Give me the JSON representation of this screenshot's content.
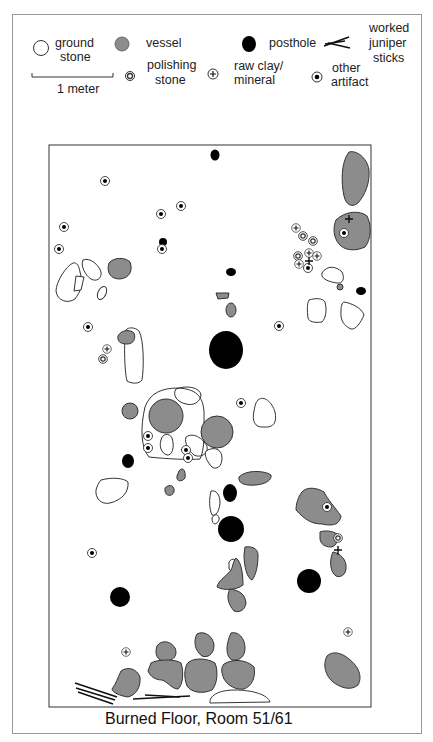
{
  "title": "Burned Floor, Room 51/61",
  "colors": {
    "vessel": "#8c8c8c",
    "posthole": "#000000",
    "stroke": "#333333",
    "frame": "#9a9a9a"
  },
  "legend": {
    "ground_stone": [
      "ground",
      "stone"
    ],
    "vessel": "vessel",
    "posthole": "posthole",
    "juniper": [
      "worked",
      "juniper",
      "sticks"
    ],
    "polishing": [
      "polishing",
      "stone"
    ],
    "clay": [
      "raw clay/",
      "mineral"
    ],
    "artifact": [
      "other",
      "artifact"
    ],
    "scale": "1 meter"
  },
  "map": {
    "postholes": [
      [
        215,
        155,
        5,
        6
      ],
      [
        163,
        242,
        4,
        4
      ],
      [
        231,
        272,
        5,
        4
      ],
      [
        361,
        291,
        5,
        4
      ],
      [
        226,
        350,
        17,
        19
      ],
      [
        128,
        461,
        6,
        7
      ],
      [
        230,
        493,
        7,
        9
      ],
      [
        231,
        529,
        13,
        13
      ],
      [
        309,
        581,
        12,
        12
      ],
      [
        120,
        597,
        10,
        10
      ]
    ],
    "artifacts": [
      [
        105,
        181
      ],
      [
        161,
        214
      ],
      [
        181,
        206
      ],
      [
        64,
        227
      ],
      [
        162,
        249
      ],
      [
        59,
        249
      ],
      [
        88,
        327
      ],
      [
        279,
        326
      ],
      [
        241,
        403
      ],
      [
        148,
        436
      ],
      [
        148,
        448
      ],
      [
        186,
        450
      ],
      [
        188,
        457
      ],
      [
        327,
        507
      ],
      [
        92,
        553
      ],
      [
        349,
        233
      ],
      [
        308,
        267
      ]
    ],
    "polishing": [
      [
        103,
        359
      ],
      [
        303,
        236
      ],
      [
        313,
        241
      ],
      [
        298,
        256
      ],
      [
        186,
        458
      ],
      [
        338,
        538
      ]
    ],
    "clay": [
      [
        296,
        228
      ],
      [
        107,
        349
      ],
      [
        309,
        253
      ],
      [
        317,
        256
      ],
      [
        299,
        264
      ],
      [
        126,
        652
      ],
      [
        348,
        632
      ],
      [
        347,
        222
      ],
      [
        338,
        551
      ]
    ],
    "vessels_circles": [
      [
        166,
        416,
        20
      ],
      [
        217,
        432,
        16
      ],
      [
        130,
        411,
        8
      ],
      [
        340,
        287,
        3
      ]
    ]
  }
}
